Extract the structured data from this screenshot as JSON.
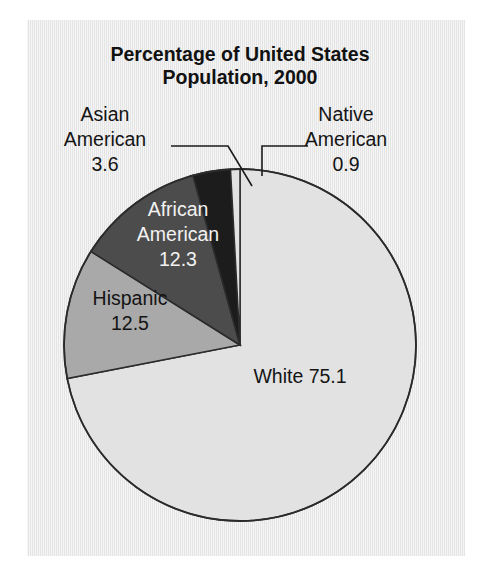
{
  "figure": {
    "title_lines": [
      "Percentage of United States",
      "Population, 2000"
    ],
    "background_color": "#e9e9e9",
    "page_color": "#ffffff",
    "outline_color": "#2b2b2b"
  },
  "chart_data": {
    "type": "pie",
    "title": "Percentage of United States Population, 2000",
    "subtitle": "",
    "xlabel": "",
    "ylabel": "",
    "grid": false,
    "legend_position": "none",
    "units": "percent",
    "total": 104.4,
    "start_angle_deg": 0,
    "direction": "clockwise",
    "center": {
      "x": 240,
      "y": 345
    },
    "radius": 176,
    "slices": [
      {
        "label": "White",
        "value": 75.1,
        "value_text": "75.1",
        "color": "#e2e2e2",
        "label_placement": "inside",
        "label_text_color": "#141414",
        "label_lines": [
          "White 75.1"
        ],
        "label_x": 300,
        "label_y": 383,
        "start_deg": 0.0,
        "end_deg": 259.0
      },
      {
        "label": "Hispanic",
        "value": 12.5,
        "value_text": "12.5",
        "color": "#a9a9a9",
        "label_placement": "inside",
        "label_text_color": "#141414",
        "label_lines": [
          "Hispanic",
          "12.5"
        ],
        "label_x": 130,
        "label_y": 305,
        "start_deg": 259.0,
        "end_deg": 302.1
      },
      {
        "label": "African American",
        "value": 12.3,
        "value_text": "12.3",
        "color": "#4c4c4c",
        "label_placement": "inside",
        "label_text_color": "#f2f2f2",
        "label_lines": [
          "African",
          "American",
          "12.3"
        ],
        "label_x": 178,
        "label_y": 216,
        "start_deg": 302.1,
        "end_deg": 344.5
      },
      {
        "label": "Asian American",
        "value": 3.6,
        "value_text": "3.6",
        "color": "#1c1c1c",
        "label_placement": "outside-left",
        "label_text_color": "#141414",
        "label_lines": [
          "Asian",
          "American",
          "3.6"
        ],
        "label_x": 105,
        "label_y": 121,
        "start_deg": 344.5,
        "end_deg": 356.9
      },
      {
        "label": "Native American",
        "value": 0.9,
        "value_text": "0.9",
        "color": "#e2e2e2",
        "label_placement": "outside-right",
        "label_text_color": "#141414",
        "label_lines": [
          "Native",
          "American",
          "0.9"
        ],
        "label_x": 346,
        "label_y": 121,
        "start_deg": 356.9,
        "end_deg": 360.0
      }
    ],
    "leader_lines": [
      {
        "for": "Asian American",
        "points": "171,146 228,146 252,186"
      },
      {
        "for": "Native American",
        "points": "308,146 262,146 262,176"
      }
    ]
  }
}
